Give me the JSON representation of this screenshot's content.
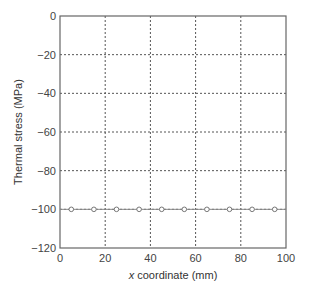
{
  "chart_data": {
    "type": "line",
    "title": "",
    "xlabel_italic": "x",
    "xlabel_rest": " coordinate (mm)",
    "xlabel": "x coordinate (mm)",
    "ylabel": "Thermal stress (MPa)",
    "xlim": [
      0,
      100
    ],
    "ylim": [
      -120,
      0
    ],
    "xticks": [
      0,
      20,
      40,
      60,
      80,
      100
    ],
    "yticks": [
      0,
      -20,
      -40,
      -60,
      -80,
      -100,
      -120
    ],
    "xtick_labels": [
      "0",
      "20",
      "40",
      "60",
      "80",
      "100"
    ],
    "ytick_labels": [
      "0",
      "−20",
      "−40",
      "−60",
      "−80",
      "−100",
      "−120"
    ],
    "grid": true,
    "grid_style": "dotted",
    "legend": null,
    "series": [
      {
        "name": "Thermal stress",
        "marker": "open-circle",
        "color": "#777777",
        "x": [
          5,
          15,
          25,
          35,
          45,
          55,
          65,
          75,
          85,
          95
        ],
        "y": [
          -100,
          -100,
          -100,
          -100,
          -100,
          -100,
          -100,
          -100,
          -100,
          -100
        ]
      }
    ]
  }
}
